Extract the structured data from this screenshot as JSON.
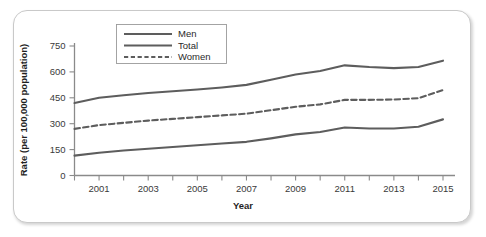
{
  "chart_data": {
    "type": "line",
    "title": "",
    "xlabel": "Year",
    "ylabel": "Rate (per 100,000 population)",
    "x": [
      2000,
      2001,
      2002,
      2003,
      2004,
      2005,
      2006,
      2007,
      2008,
      2009,
      2010,
      2011,
      2012,
      2013,
      2014,
      2015
    ],
    "xlim": [
      2000,
      2015
    ],
    "ylim": [
      0,
      800
    ],
    "yticks": [
      0,
      150,
      300,
      450,
      600,
      750
    ],
    "xticks": [
      2000,
      2001,
      2002,
      2003,
      2004,
      2005,
      2006,
      2007,
      2008,
      2009,
      2010,
      2011,
      2012,
      2013,
      2014,
      2015
    ],
    "xticklabels": [
      "",
      "2001",
      "",
      "2003",
      "",
      "2005",
      "",
      "2007",
      "",
      "2009",
      "",
      "2011",
      "",
      "2013",
      "",
      "2015"
    ],
    "grid": false,
    "legend_position": "upper-left-inside",
    "series": [
      {
        "name": "Total",
        "style": "solid",
        "color": "#5d5d5d",
        "values": [
          420,
          450,
          465,
          478,
          488,
          498,
          510,
          525,
          555,
          585,
          605,
          638,
          628,
          622,
          628,
          665
        ]
      },
      {
        "name": "Women",
        "style": "dashed",
        "color": "#5d5d5d",
        "values": [
          270,
          292,
          305,
          318,
          328,
          338,
          348,
          358,
          378,
          398,
          412,
          438,
          438,
          440,
          448,
          495
        ]
      },
      {
        "name": "Men",
        "style": "solid",
        "color": "#5d5d5d",
        "values": [
          115,
          132,
          145,
          155,
          165,
          175,
          185,
          195,
          215,
          238,
          252,
          278,
          272,
          272,
          282,
          325
        ]
      }
    ]
  },
  "axes": {
    "ylabel": "Rate (per 100,000 population)",
    "xlabel": "Year",
    "ytick_labels": [
      "750",
      "600",
      "450",
      "300",
      "150",
      "0"
    ],
    "xtick_labels": [
      "2001",
      "2003",
      "2005",
      "2007",
      "2009",
      "2011",
      "2013",
      "2015"
    ]
  },
  "legend": {
    "entries": [
      {
        "label": "Men",
        "style": "solid"
      },
      {
        "label": "Total",
        "style": "solid"
      },
      {
        "label": "Women",
        "style": "dashed"
      }
    ]
  },
  "colors": {
    "line": "#5d5d5d",
    "axis": "#8a8a8a",
    "text": "#2a2a2a",
    "frame": "#c9c9c9",
    "background": "#ffffff"
  }
}
